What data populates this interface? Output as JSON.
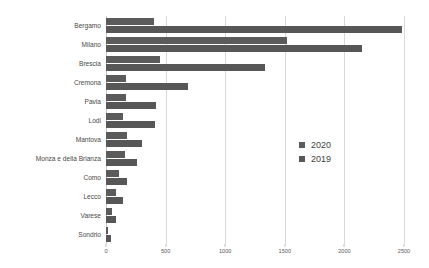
{
  "chart_data": {
    "type": "bar",
    "orientation": "horizontal",
    "title": "",
    "subtitle": "",
    "xlabel": "",
    "ylabel": "",
    "xlim": [
      0,
      2500
    ],
    "xticks": [
      0,
      500,
      1000,
      1500,
      2000,
      2500
    ],
    "xticklabels": [
      "0",
      "500",
      "1000",
      "1500",
      "2000",
      "2500"
    ],
    "grid": "vertical",
    "legend_position": "center-right",
    "categories": [
      "Bergamo",
      "Milano",
      "Brescia",
      "Cremona",
      "Pavia",
      "Lodi",
      "Mantova",
      "Monza e della Brianza",
      "Como",
      "Lecco",
      "Varese",
      "Sondrio"
    ],
    "series": [
      {
        "name": "2020",
        "color": "#5b5b5b",
        "values": [
          400,
          1520,
          450,
          170,
          170,
          140,
          175,
          160,
          110,
          80,
          50,
          20
        ]
      },
      {
        "name": "2019",
        "color": "#575757",
        "values": [
          2480,
          2150,
          1330,
          690,
          420,
          410,
          300,
          260,
          175,
          140,
          85,
          40
        ]
      }
    ]
  },
  "legend": {
    "items": [
      {
        "label": "2020",
        "color": "#5b5b5b"
      },
      {
        "label": "2019",
        "color": "#575757"
      }
    ]
  }
}
